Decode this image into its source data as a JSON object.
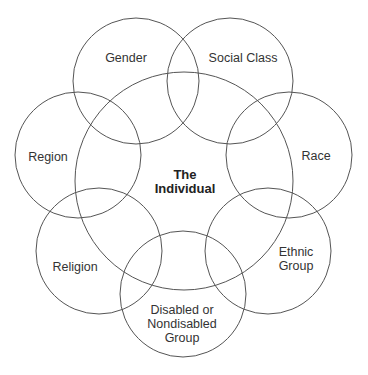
{
  "diagram": {
    "center": {
      "label_line1": "The",
      "label_line2": "Individual"
    },
    "groups": [
      {
        "id": "gender",
        "line1": "Gender",
        "line2": "",
        "line3": ""
      },
      {
        "id": "social-class",
        "line1": "Social Class",
        "line2": "",
        "line3": ""
      },
      {
        "id": "region",
        "line1": "Region",
        "line2": "",
        "line3": ""
      },
      {
        "id": "race",
        "line1": "Race",
        "line2": "",
        "line3": ""
      },
      {
        "id": "religion",
        "line1": "Religion",
        "line2": "",
        "line3": ""
      },
      {
        "id": "ethnic-group",
        "line1": "Ethnic",
        "line2": "Group",
        "line3": ""
      },
      {
        "id": "disabled-group",
        "line1": "Disabled or",
        "line2": "Nondisabled",
        "line3": "Group"
      }
    ],
    "stroke_color": "#555555"
  }
}
